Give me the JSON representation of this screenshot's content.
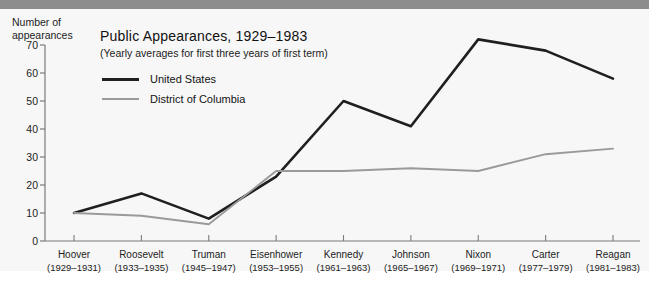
{
  "chart_data": {
    "type": "line",
    "title": "Public Appearances, 1929–1983",
    "subtitle": "(Yearly averages for first three years of first term)",
    "ylabel": "Number of\nappearances",
    "xlabel": "",
    "ylim": [
      0,
      70
    ],
    "yticks": [
      0,
      10,
      20,
      30,
      40,
      50,
      60,
      70
    ],
    "grid": false,
    "legend_position": "upper-left-inside",
    "categories": [
      "Hoover",
      "Roosevelt",
      "Truman",
      "Eisenhower",
      "Kennedy",
      "Johnson",
      "Nixon",
      "Carter",
      "Reagan"
    ],
    "category_years": [
      "(1929–1931)",
      "(1933–1935)",
      "(1945–1947)",
      "(1953–1955)",
      "(1961–1963)",
      "(1965–1967)",
      "(1969–1971)",
      "(1977–1979)",
      "(1981–1983)"
    ],
    "series": [
      {
        "name": "United States",
        "color": "#201f1f",
        "values": [
          10,
          17,
          8,
          23,
          50,
          41,
          72,
          68,
          58
        ]
      },
      {
        "name": "District of Columbia",
        "color": "#9a9a9a",
        "values": [
          10,
          9,
          6,
          25,
          25,
          26,
          25,
          31,
          33
        ]
      }
    ]
  },
  "axis": {
    "y_title": "Number of\nappearances",
    "y_tick_labels": [
      "70",
      "60",
      "50",
      "40",
      "30",
      "20",
      "10",
      "0"
    ]
  },
  "legend": {
    "items": [
      {
        "label": "United States"
      },
      {
        "label": "District of Columbia"
      }
    ]
  }
}
